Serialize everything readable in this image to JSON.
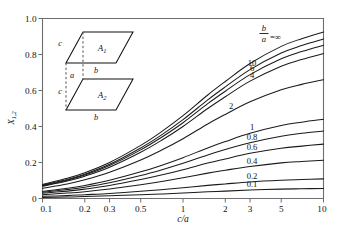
{
  "chart_data": {
    "type": "line",
    "title": "",
    "xlabel": "c/a",
    "ylabel": "X",
    "ylabel_sub": "1,2",
    "xscale": "log",
    "xlim": [
      0.1,
      10
    ],
    "ylim": [
      0,
      1.0
    ],
    "grid": false,
    "legend_position": "inline-right",
    "xticks": [
      "0.1",
      "0.2",
      "0.3",
      "0.5",
      "1",
      "2",
      "3",
      "5",
      "10"
    ],
    "xtick_values": [
      0.1,
      0.2,
      0.3,
      0.5,
      1,
      2,
      3,
      5,
      10
    ],
    "yticks": [
      "0",
      "0.2",
      "0.4",
      "0.6",
      "0.8",
      "1.0"
    ],
    "ytick_values": [
      0,
      0.2,
      0.4,
      0.6,
      0.8,
      1.0
    ],
    "series_parameter": "b/a",
    "x": [
      0.1,
      0.15,
      0.2,
      0.3,
      0.5,
      0.7,
      1,
      1.5,
      2,
      3,
      5,
      7,
      10
    ],
    "series": [
      {
        "name": "inf",
        "label": "=∞",
        "label_prefix": "b/a",
        "values": [
          0.078,
          0.112,
          0.143,
          0.2,
          0.295,
          0.37,
          0.46,
          0.575,
          0.65,
          0.75,
          0.845,
          0.888,
          0.925
        ]
      },
      {
        "name": "10",
        "label": "10",
        "values": [
          0.074,
          0.106,
          0.135,
          0.19,
          0.281,
          0.352,
          0.438,
          0.548,
          0.62,
          0.716,
          0.808,
          0.85,
          0.886
        ]
      },
      {
        "name": "6",
        "label": "6",
        "values": [
          0.071,
          0.102,
          0.13,
          0.183,
          0.27,
          0.339,
          0.421,
          0.527,
          0.596,
          0.688,
          0.776,
          0.816,
          0.851
        ]
      },
      {
        "name": "4",
        "label": "4",
        "values": [
          0.068,
          0.097,
          0.124,
          0.174,
          0.257,
          0.322,
          0.4,
          0.5,
          0.565,
          0.652,
          0.735,
          0.772,
          0.805
        ]
      },
      {
        "name": "2",
        "label": "2",
        "values": [
          0.057,
          0.081,
          0.104,
          0.146,
          0.214,
          0.268,
          0.332,
          0.414,
          0.467,
          0.537,
          0.604,
          0.634,
          0.66
        ]
      },
      {
        "name": "1",
        "label": "1",
        "values": [
          0.04,
          0.057,
          0.072,
          0.101,
          0.148,
          0.184,
          0.227,
          0.281,
          0.316,
          0.362,
          0.405,
          0.424,
          0.44
        ]
      },
      {
        "name": "0.8",
        "label": "0.8",
        "values": [
          0.035,
          0.05,
          0.063,
          0.088,
          0.128,
          0.159,
          0.196,
          0.242,
          0.272,
          0.31,
          0.346,
          0.362,
          0.375
        ]
      },
      {
        "name": "0.6",
        "label": "0.6",
        "values": [
          0.029,
          0.041,
          0.052,
          0.072,
          0.105,
          0.13,
          0.16,
          0.197,
          0.22,
          0.251,
          0.279,
          0.291,
          0.302
        ]
      },
      {
        "name": "0.4",
        "label": "0.4",
        "values": [
          0.021,
          0.03,
          0.038,
          0.053,
          0.076,
          0.094,
          0.115,
          0.141,
          0.157,
          0.178,
          0.198,
          0.206,
          0.213
        ]
      },
      {
        "name": "0.2",
        "label": "0.2",
        "values": [
          0.012,
          0.016,
          0.021,
          0.028,
          0.04,
          0.049,
          0.06,
          0.073,
          0.081,
          0.092,
          0.101,
          0.105,
          0.109
        ]
      },
      {
        "name": "0.1",
        "label": "0.1",
        "values": [
          0.006,
          0.008,
          0.011,
          0.015,
          0.021,
          0.025,
          0.031,
          0.037,
          0.041,
          0.047,
          0.052,
          0.054,
          0.056
        ]
      }
    ]
  },
  "inset": {
    "area_top": "A",
    "area_top_sub": "1",
    "area_bottom": "A",
    "area_bottom_sub": "2",
    "edge_c_top": "c",
    "edge_c_bottom": "c",
    "edge_b_top": "b",
    "edge_b_bottom": "b",
    "gap_a": "a"
  },
  "labels": {
    "param_numerator": "b",
    "param_denominator": "a",
    "param_equals": "=∞"
  }
}
